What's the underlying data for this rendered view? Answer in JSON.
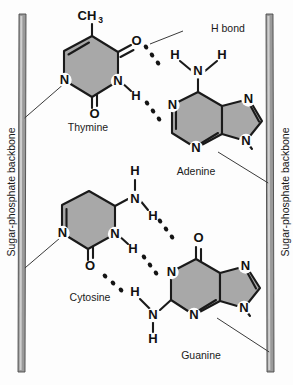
{
  "figure": {
    "background_color": "#fdfdfd",
    "ring_fill_color": "#a8a8a8",
    "line_color": "#1a1a1a",
    "backbone_color": "#9a9a9a"
  },
  "annotations": {
    "h_bond_label": "H bond",
    "backbone_left_label": "Sugar-phosphate backbone",
    "backbone_right_label": "Sugar-phosphate backbone"
  },
  "bases": {
    "thymine": {
      "name": "Thymine",
      "methyl": "CH",
      "methyl_sub": "3",
      "atoms": [
        "O",
        "N",
        "N",
        "O",
        "H"
      ]
    },
    "adenine": {
      "name": "Adenine",
      "atoms": [
        "H",
        "N",
        "H",
        "N",
        "N",
        "N"
      ]
    },
    "cytosine": {
      "name": "Cytosine",
      "atoms": [
        "H",
        "N",
        "H",
        "N",
        "N",
        "O",
        "H"
      ]
    },
    "guanine": {
      "name": "Guanine",
      "atoms": [
        "O",
        "N",
        "N",
        "N",
        "N",
        "H",
        "H"
      ]
    }
  },
  "pairs": [
    {
      "id": "thymine-adenine",
      "left_base": "Thymine",
      "right_base": "Adenine",
      "hydrogen_bonds": 2
    },
    {
      "id": "cytosine-guanine",
      "left_base": "Cytosine",
      "right_base": "Guanine",
      "hydrogen_bonds": 3
    }
  ]
}
